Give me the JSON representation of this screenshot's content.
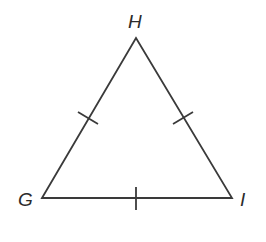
{
  "diagram": {
    "type": "triangle",
    "vertices": [
      {
        "name": "H",
        "label": "H",
        "x": 136,
        "y": 38,
        "label_x": 128,
        "label_y": 12
      },
      {
        "name": "G",
        "label": "G",
        "x": 42,
        "y": 198,
        "label_x": 18,
        "label_y": 190
      },
      {
        "name": "I",
        "label": "I",
        "x": 232,
        "y": 198,
        "label_x": 240,
        "label_y": 190
      }
    ],
    "sides": [
      {
        "name": "GH",
        "tick_marks": 1
      },
      {
        "name": "HI",
        "tick_marks": 1
      },
      {
        "name": "GI",
        "tick_marks": 1
      }
    ],
    "colors": {
      "line": "#3a3a3a",
      "background": "#ffffff"
    }
  }
}
